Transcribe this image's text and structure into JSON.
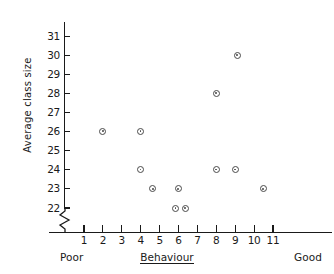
{
  "chart_data": {
    "type": "scatter",
    "title": "",
    "xlabel": "Behaviour",
    "ylabel": "Average class size",
    "xlim": [
      0,
      11.8
    ],
    "ylim": [
      21.6,
      31.4
    ],
    "grid": false,
    "legend": null,
    "x_tick_labels": [
      "1",
      "2",
      "3",
      "4",
      "5",
      "6",
      "7",
      "8",
      "9",
      "10",
      "11"
    ],
    "x_ticks": [
      1,
      2,
      3,
      4,
      5,
      6,
      7,
      8,
      9,
      10,
      11
    ],
    "y_tick_labels": [
      "22",
      "23",
      "24",
      "25",
      "26",
      "27",
      "28",
      "29",
      "30",
      "31"
    ],
    "y_ticks": [
      22,
      23,
      24,
      25,
      26,
      27,
      28,
      29,
      30,
      31
    ],
    "y_axis_break": true,
    "x_axis_low_annotation": "Poor",
    "x_axis_high_annotation": "Good",
    "marker": "circle-with-center-dot",
    "points": [
      {
        "x": 2.0,
        "y": 26
      },
      {
        "x": 4.0,
        "y": 26
      },
      {
        "x": 4.0,
        "y": 24
      },
      {
        "x": 4.65,
        "y": 23
      },
      {
        "x": 6.0,
        "y": 23
      },
      {
        "x": 5.85,
        "y": 22
      },
      {
        "x": 6.35,
        "y": 22
      },
      {
        "x": 8.0,
        "y": 28
      },
      {
        "x": 8.0,
        "y": 24
      },
      {
        "x": 9.0,
        "y": 24
      },
      {
        "x": 9.1,
        "y": 30
      },
      {
        "x": 10.5,
        "y": 23
      }
    ]
  },
  "axes": {
    "y_title": "Average class size",
    "x_title": "Behaviour",
    "poor": "Poor",
    "good": "Good"
  },
  "colors": {
    "ink": "#1a1a1a",
    "marker": "#4a4a4a",
    "background": "#ffffff"
  }
}
